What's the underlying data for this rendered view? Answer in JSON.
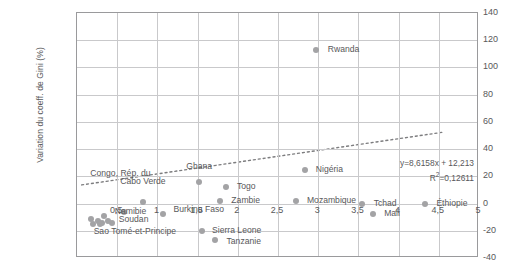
{
  "chart_data": {
    "type": "scatter",
    "title": "",
    "xlabel": "",
    "ylabel": "Variation du coeff. de Gini (%)",
    "xlim": [
      0,
      5
    ],
    "ylim": [
      -40,
      140
    ],
    "grid": true,
    "legend": "none",
    "xticks": [
      "0,5",
      "1",
      "1,5",
      "2",
      "2,5",
      "3",
      "3,5",
      "4",
      "4,5",
      "5"
    ],
    "xtick_values": [
      0.5,
      1,
      1.5,
      2,
      2.5,
      3,
      3.5,
      4,
      4.5,
      5
    ],
    "yticks": [
      "140",
      "120",
      "100",
      "80",
      "60",
      "40",
      "20",
      "0",
      "-20",
      "-40"
    ],
    "ytick_values": [
      140,
      120,
      100,
      80,
      60,
      40,
      20,
      0,
      -20,
      -40
    ],
    "ytick_side": "right",
    "point_color": "#a3a3a5",
    "axis_color": "#9a9a9c",
    "grid_color": "#c9c9cb",
    "text_color": "#58585a",
    "points": [
      {
        "label": "Rwanda",
        "x": 2.97,
        "y": 113,
        "lx": 3.12,
        "ly": 113,
        "align": "left"
      },
      {
        "label": "Nigéria",
        "x": 2.83,
        "y": 25,
        "lx": 2.97,
        "ly": 25,
        "align": "left"
      },
      {
        "label": "Ghana",
        "x": 1.52,
        "y": 16,
        "lx": 1.52,
        "ly": 27,
        "align": "center"
      },
      {
        "label": "Togo",
        "x": 1.85,
        "y": 12,
        "lx": 1.99,
        "ly": 12,
        "align": "left"
      },
      {
        "label": "Zambie",
        "x": 1.78,
        "y": 2,
        "lx": 1.92,
        "ly": 2,
        "align": "left"
      },
      {
        "label": "Mozambique",
        "x": 2.72,
        "y": 2,
        "lx": 2.86,
        "ly": 2,
        "align": "left"
      },
      {
        "label": "Tchad",
        "x": 3.55,
        "y": 0,
        "lx": 3.69,
        "ly": 0,
        "align": "left"
      },
      {
        "label": "Mali",
        "x": 3.68,
        "y": -8,
        "lx": 3.82,
        "ly": -8,
        "align": "left"
      },
      {
        "label": "Éthiopie",
        "x": 4.33,
        "y": 0,
        "lx": 4.47,
        "ly": 0,
        "align": "left"
      },
      {
        "label": "Cabo Verde",
        "x": 0.82,
        "y": 1,
        "lx": 0.82,
        "ly": 16,
        "align": "center"
      },
      {
        "label": "Congo, Rép. du",
        "x": 0.58,
        "y": -6,
        "lx": 0.54,
        "ly": 22,
        "align": "center"
      },
      {
        "label": "Burkina Faso",
        "x": 1.07,
        "y": -8,
        "lx": 1.2,
        "ly": -5,
        "align": "left"
      },
      {
        "label": "Namibie",
        "x": 0.33,
        "y": -9,
        "lx": 0.47,
        "ly": -6,
        "align": "left"
      },
      {
        "label": "Soudan",
        "x": 0.38,
        "y": -13,
        "lx": 0.52,
        "ly": -12,
        "align": "left"
      },
      {
        "label": "Sao Tomé-et-Principe",
        "x": 0.28,
        "y": -15,
        "lx": 0.72,
        "ly": -21,
        "align": "center"
      },
      {
        "label": "Sierra Leone",
        "x": 1.55,
        "y": -20,
        "lx": 1.68,
        "ly": -20,
        "align": "left"
      },
      {
        "label": "Tanzanie",
        "x": 1.72,
        "y": -27,
        "lx": 1.86,
        "ly": -28,
        "align": "left"
      }
    ],
    "extra_points": [
      {
        "x": 0.18,
        "y": -11
      },
      {
        "x": 0.26,
        "y": -13
      },
      {
        "x": 0.31,
        "y": -14
      },
      {
        "x": 0.44,
        "y": -14
      },
      {
        "x": 0.2,
        "y": -15
      }
    ],
    "trendline": {
      "slope": 8.6158,
      "intercept": 12.213,
      "style": "dotted",
      "x_start": 0.05,
      "x_end": 4.6,
      "equation": "y=8,6158x + 12,213",
      "r2_prefix": "R",
      "r2_sup": "2",
      "r2_value": "=0,12611"
    }
  }
}
